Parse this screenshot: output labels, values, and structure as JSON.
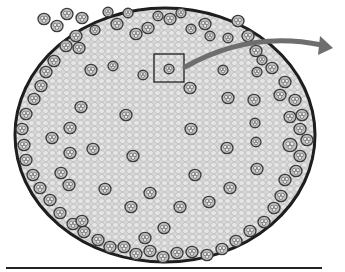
{
  "figure": {
    "colors": {
      "background": "#ffffff",
      "ground_tissue": "#d6d6d6",
      "cell_wall": "#9a9a9a",
      "epidermis": "#1e1e1e",
      "bundle_ring": "#3a3a3a",
      "bundle_fill": "#bdbdbd",
      "arrow": "#6e6e6e",
      "box": "#111111",
      "baseline": "#222222"
    },
    "stem": {
      "cx": 165,
      "cy": 135,
      "rx": 150,
      "ry": 127
    },
    "highlight_box": {
      "x": 154,
      "y": 54,
      "width": 30,
      "height": 28
    },
    "arrow": {
      "start": [
        185,
        67
      ],
      "control": [
        250,
        30
      ],
      "end": [
        322,
        45
      ],
      "tip": [
        333,
        48
      ]
    },
    "baseline": {
      "x1": 6,
      "y1": 268,
      "x2": 322,
      "y2": 268
    },
    "vascular_bundles": [
      [
        44,
        19,
        6
      ],
      [
        57,
        26,
        6
      ],
      [
        67,
        14,
        6
      ],
      [
        76,
        36,
        6
      ],
      [
        82,
        18,
        6
      ],
      [
        95,
        30,
        5
      ],
      [
        108,
        12,
        5
      ],
      [
        117,
        24,
        6
      ],
      [
        128,
        13,
        5
      ],
      [
        136,
        34,
        6
      ],
      [
        148,
        28,
        6
      ],
      [
        158,
        16,
        5
      ],
      [
        170,
        19,
        6
      ],
      [
        181,
        13,
        5
      ],
      [
        191,
        29,
        5
      ],
      [
        205,
        24,
        6
      ],
      [
        210,
        36,
        5
      ],
      [
        228,
        38,
        5
      ],
      [
        238,
        21,
        6
      ],
      [
        248,
        36,
        6
      ],
      [
        256,
        51,
        6
      ],
      [
        262,
        60,
        5
      ],
      [
        272,
        68,
        6
      ],
      [
        285,
        82,
        6
      ],
      [
        280,
        95,
        6
      ],
      [
        295,
        100,
        6
      ],
      [
        302,
        115,
        6
      ],
      [
        290,
        117,
        6
      ],
      [
        300,
        129,
        6
      ],
      [
        307,
        140,
        6
      ],
      [
        290,
        145,
        7
      ],
      [
        300,
        156,
        6
      ],
      [
        296,
        171,
        6
      ],
      [
        285,
        180,
        6
      ],
      [
        281,
        196,
        6
      ],
      [
        274,
        208,
        6
      ],
      [
        264,
        222,
        6
      ],
      [
        250,
        231,
        6
      ],
      [
        236,
        241,
        6
      ],
      [
        222,
        249,
        6
      ],
      [
        207,
        255,
        6
      ],
      [
        192,
        252,
        6
      ],
      [
        177,
        253,
        6
      ],
      [
        163,
        257,
        6
      ],
      [
        150,
        251,
        6
      ],
      [
        136,
        254,
        6
      ],
      [
        124,
        247,
        6
      ],
      [
        110,
        247,
        6
      ],
      [
        98,
        240,
        6
      ],
      [
        84,
        232,
        6
      ],
      [
        73,
        224,
        6
      ],
      [
        60,
        213,
        6
      ],
      [
        50,
        200,
        6
      ],
      [
        40,
        188,
        6
      ],
      [
        33,
        175,
        6
      ],
      [
        26,
        160,
        6
      ],
      [
        24,
        145,
        6
      ],
      [
        22,
        129,
        6
      ],
      [
        26,
        114,
        6
      ],
      [
        34,
        99,
        6
      ],
      [
        41,
        86,
        6
      ],
      [
        46,
        72,
        6
      ],
      [
        54,
        61,
        6
      ],
      [
        66,
        46,
        6
      ],
      [
        79,
        48,
        6
      ],
      [
        91,
        70,
        6
      ],
      [
        113,
        66,
        5
      ],
      [
        143,
        75,
        5
      ],
      [
        169,
        69,
        5
      ],
      [
        190,
        88,
        6
      ],
      [
        223,
        70,
        5
      ],
      [
        257,
        72,
        5
      ],
      [
        254,
        100,
        6
      ],
      [
        228,
        98,
        6
      ],
      [
        255,
        123,
        5
      ],
      [
        256,
        142,
        5
      ],
      [
        227,
        148,
        6
      ],
      [
        257,
        169,
        6
      ],
      [
        230,
        188,
        6
      ],
      [
        209,
        202,
        6
      ],
      [
        195,
        175,
        6
      ],
      [
        180,
        207,
        6
      ],
      [
        150,
        193,
        6
      ],
      [
        131,
        207,
        6
      ],
      [
        105,
        189,
        6
      ],
      [
        93,
        149,
        6
      ],
      [
        70,
        153,
        6
      ],
      [
        61,
        173,
        6
      ],
      [
        52,
        138,
        6
      ],
      [
        70,
        128,
        6
      ],
      [
        81,
        107,
        6
      ],
      [
        126,
        115,
        6
      ],
      [
        133,
        156,
        6
      ],
      [
        191,
        129,
        6
      ],
      [
        145,
        238,
        6
      ],
      [
        164,
        228,
        6
      ],
      [
        82,
        221,
        6
      ],
      [
        69,
        185,
        6
      ]
    ]
  }
}
